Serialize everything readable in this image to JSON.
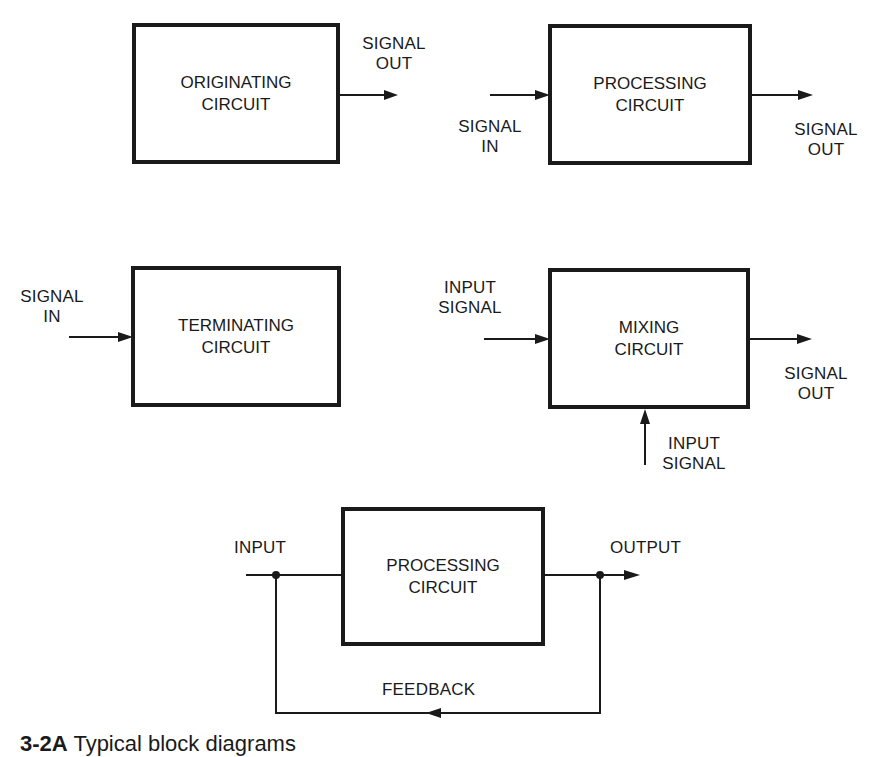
{
  "figure": {
    "caption_number": "3-2A",
    "caption_text": "Typical block diagrams"
  },
  "blocks": {
    "originating": {
      "label": "ORIGINATING\nCIRCUIT",
      "output_label": "SIGNAL\nOUT"
    },
    "processing": {
      "label": "PROCESSING\nCIRCUIT",
      "input_label": "SIGNAL\nIN",
      "output_label": "SIGNAL\nOUT"
    },
    "terminating": {
      "label": "TERMINATING\nCIRCUIT",
      "input_label": "SIGNAL\nIN"
    },
    "mixing": {
      "label": "MIXING\nCIRCUIT",
      "input_label_left": "INPUT\nSIGNAL",
      "input_label_bottom": "INPUT\nSIGNAL",
      "output_label": "SIGNAL\nOUT"
    },
    "feedback_processing": {
      "label": "PROCESSING\nCIRCUIT",
      "input_label": "INPUT",
      "output_label": "OUTPUT",
      "feedback_label": "FEEDBACK"
    }
  },
  "colors": {
    "ink": "#1a1a1a",
    "background": "#ffffff"
  }
}
